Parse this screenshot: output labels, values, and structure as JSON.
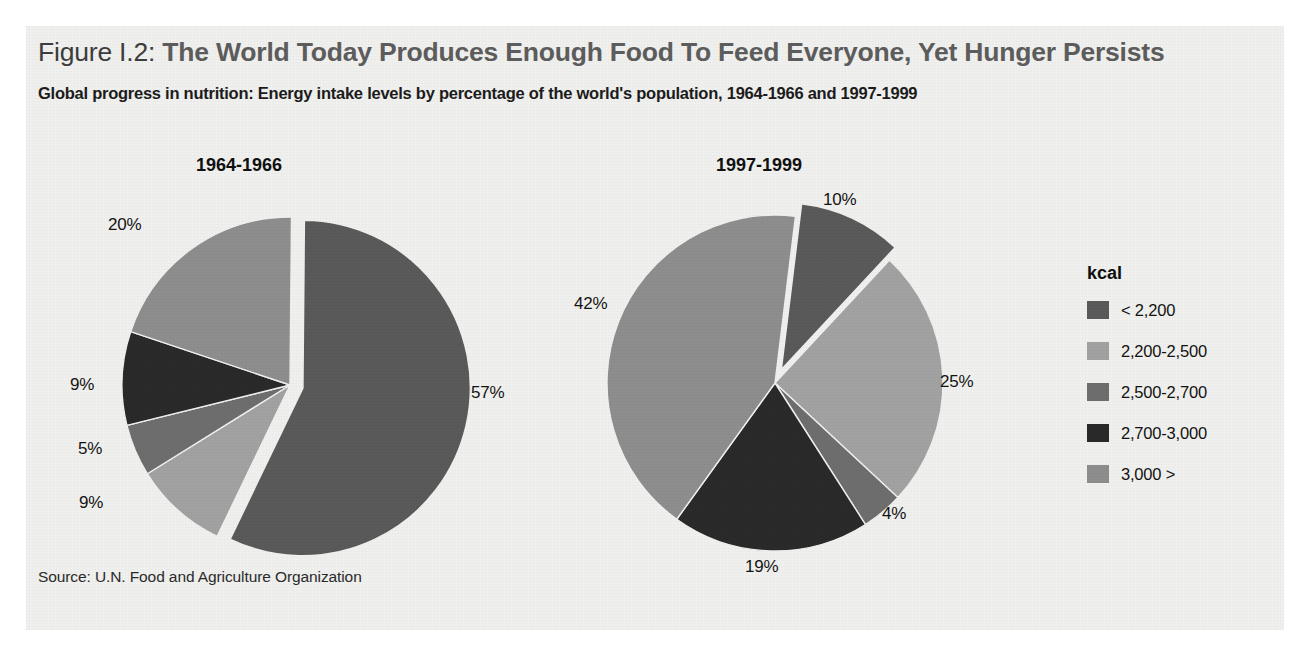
{
  "figure": {
    "figure_number": "Figure I.2:",
    "title": "The World Today Produces Enough Food To Feed Everyone, Yet Hunger Persists",
    "subtitle": "Global progress in nutrition: Energy intake levels by percentage of the world's population, 1964-1966 and 1997-1999",
    "source": "Source: U.N. Food and Agriculture Organization"
  },
  "legend": {
    "title": "kcal",
    "items": [
      {
        "label": "< 2,200",
        "color": "#5a5a5a"
      },
      {
        "label": "2,200-2,500",
        "color": "#a2a2a2"
      },
      {
        "label": "2,500-2,700",
        "color": "#6e6e6e"
      },
      {
        "label": "2,700-3,000",
        "color": "#2a2a2a"
      },
      {
        "label": "3,000 >",
        "color": "#8e8e8e"
      }
    ]
  },
  "colors": {
    "panel_background": "#f0f0ee",
    "page_background": "#ffffff",
    "title_figno": "#3d3d3d",
    "title_main": "#5d5d5d",
    "text": "#141414"
  },
  "chart_data": [
    {
      "type": "pie",
      "title": "1964-1966",
      "categories": [
        "< 2,200",
        "2,200-2,500",
        "2,500-2,700",
        "2,700-3,000",
        "3,000 >"
      ],
      "values": [
        57,
        9,
        5,
        9,
        20
      ],
      "labels": [
        "57%",
        "9%",
        "5%",
        "9%",
        "20%"
      ],
      "colors": [
        "#5a5a5a",
        "#a2a2a2",
        "#6e6e6e",
        "#2a2a2a",
        "#8e8e8e"
      ],
      "exploded": [
        "< 2,200"
      ],
      "units": "percent of world population",
      "legend_position": "right"
    },
    {
      "type": "pie",
      "title": "1997-1999",
      "categories": [
        "< 2,200",
        "2,200-2,500",
        "2,500-2,700",
        "2,700-3,000",
        "3,000 >"
      ],
      "values": [
        10,
        25,
        4,
        19,
        42
      ],
      "labels": [
        "10%",
        "25%",
        "4%",
        "19%",
        "42%"
      ],
      "colors": [
        "#5a5a5a",
        "#a2a2a2",
        "#6e6e6e",
        "#2a2a2a",
        "#8e8e8e"
      ],
      "exploded": [
        "< 2,200"
      ],
      "units": "percent of world population",
      "legend_position": "right"
    }
  ],
  "pies": [
    {
      "id": "pie-1964",
      "title": "1964-1966",
      "title_left": 196,
      "title_top": 155,
      "cx": 290,
      "cy": 385,
      "r": 168,
      "start_angle": -89.5,
      "explode_offset": 13,
      "slices": [
        {
          "name": "< 2,200",
          "value": 57,
          "label": "57%",
          "color": "#5a5a5a",
          "explode": true,
          "label_left": 471,
          "label_top": 383
        },
        {
          "name": "2,200-2,500",
          "value": 9,
          "label": "9%",
          "color": "#a2a2a2",
          "explode": false,
          "label_left": 79,
          "label_top": 493
        },
        {
          "name": "2,500-2,700",
          "value": 5,
          "label": "5%",
          "color": "#6e6e6e",
          "explode": false,
          "label_left": 78,
          "label_top": 439
        },
        {
          "name": "2,700-3,000",
          "value": 9,
          "label": "9%",
          "color": "#2a2a2a",
          "explode": false,
          "label_left": 70,
          "label_top": 375
        },
        {
          "name": "3,000 >",
          "value": 20,
          "label": "20%",
          "color": "#8e8e8e",
          "explode": false,
          "label_left": 108,
          "label_top": 215
        }
      ]
    },
    {
      "id": "pie-1997",
      "title": "1997-1999",
      "title_left": 716,
      "title_top": 155,
      "cx": 775,
      "cy": 383,
      "r": 168,
      "start_angle": -83,
      "explode_offset": 14,
      "slices": [
        {
          "name": "< 2,200",
          "value": 10,
          "label": "10%",
          "color": "#5a5a5a",
          "explode": true,
          "label_left": 823,
          "label_top": 190
        },
        {
          "name": "2,200-2,500",
          "value": 25,
          "label": "25%",
          "color": "#a2a2a2",
          "explode": false,
          "label_left": 940,
          "label_top": 372
        },
        {
          "name": "2,500-2,700",
          "value": 4,
          "label": "4%",
          "color": "#6e6e6e",
          "explode": false,
          "label_left": 882,
          "label_top": 504
        },
        {
          "name": "2,700-3,000",
          "value": 19,
          "label": "19%",
          "color": "#2a2a2a",
          "explode": false,
          "label_left": 745,
          "label_top": 557
        },
        {
          "name": "3,000 >",
          "value": 42,
          "label": "42%",
          "color": "#8e8e8e",
          "explode": false,
          "label_left": 574,
          "label_top": 294
        }
      ]
    }
  ]
}
